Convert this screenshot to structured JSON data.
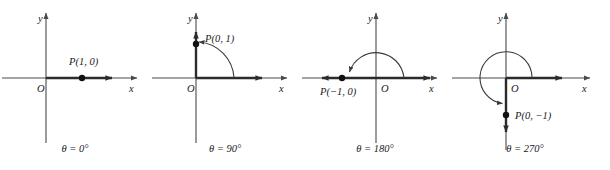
{
  "figure": {
    "background_color": "#ffffff",
    "axis_color": "#4a4a4a",
    "ray_color": "#2b2b2b",
    "point_color": "#111111",
    "panel_count": 4
  },
  "axis_labels": {
    "x": "x",
    "y": "y",
    "origin": "O"
  },
  "panels": [
    {
      "id": "theta-0",
      "caption": "θ = 0°",
      "angle_degrees": 0,
      "point_label": "P(1, 0)",
      "point_x": 1,
      "point_y": 0,
      "ray_direction": "positive-x",
      "arc": "none",
      "label_position": "above-right-of-point"
    },
    {
      "id": "theta-90",
      "caption": "θ = 90°",
      "angle_degrees": 90,
      "point_label": "P(0, 1)",
      "point_x": 0,
      "point_y": 1,
      "ray_direction": "positive-y",
      "arc": "quarter-turn-counterclockwise",
      "label_position": "right-of-point"
    },
    {
      "id": "theta-180",
      "caption": "θ = 180°",
      "angle_degrees": 180,
      "point_label": "P(−1, 0)",
      "point_x": -1,
      "point_y": 0,
      "ray_direction": "negative-x",
      "arc": "half-turn-counterclockwise",
      "label_position": "below-point"
    },
    {
      "id": "theta-270",
      "caption": "θ = 270°",
      "angle_degrees": 270,
      "point_label": "P(0, −1)",
      "point_x": 0,
      "point_y": -1,
      "ray_direction": "negative-y",
      "arc": "three-quarter-turn-counterclockwise",
      "label_position": "right-of-point"
    }
  ]
}
